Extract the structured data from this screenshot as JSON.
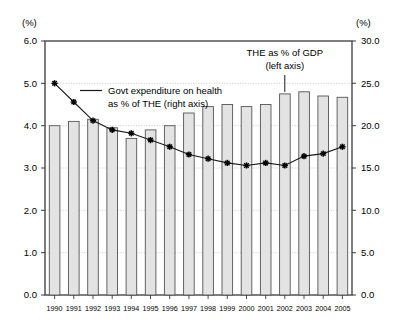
{
  "chart_data": {
    "type": "bar",
    "title": "",
    "categories": [
      "1990",
      "1991",
      "1992",
      "1993",
      "1994",
      "1995",
      "1996",
      "1997",
      "1998",
      "1999",
      "2000",
      "2001",
      "2002",
      "2003",
      "2004",
      "2005"
    ],
    "series": [
      {
        "name": "THE as % of GDP (left axis)",
        "axis": "left",
        "render": "bar",
        "values": [
          4.0,
          4.1,
          4.15,
          3.95,
          3.7,
          3.9,
          4.0,
          4.3,
          4.45,
          4.5,
          4.45,
          4.5,
          4.75,
          4.8,
          4.7,
          4.67
        ]
      },
      {
        "name": "Govt expenditure on health as % of THE (right axis)",
        "axis": "right",
        "render": "line",
        "values": [
          25.0,
          22.8,
          20.6,
          19.5,
          19.1,
          18.3,
          17.5,
          16.6,
          16.1,
          15.6,
          15.3,
          15.6,
          15.3,
          16.4,
          16.7,
          17.5
        ]
      }
    ],
    "xlabel": "",
    "ylabel_left": "(%)",
    "ylabel_right": "(%)",
    "ylim_left": [
      0.0,
      6.0
    ],
    "ylim_right": [
      0.0,
      30.0
    ],
    "yticks_left": [
      "0.0",
      "1.0",
      "2.0",
      "3.0",
      "4.0",
      "5.0",
      "6.0"
    ],
    "yticks_right": [
      "0.0",
      "5.0",
      "10.0",
      "15.0",
      "20.0",
      "25.0",
      "30.0"
    ],
    "grid": true,
    "legend_position": "inside-plot",
    "annotations": [
      {
        "name": "line-series-legend",
        "line1": "Govt expenditure on health",
        "line2": "as % of THE (right axis)"
      },
      {
        "name": "bar-series-callout",
        "line1": "THE as % of GDP",
        "line2": "(left axis)",
        "points_to_category": "2002"
      }
    ],
    "colors": {
      "bar_fill": "#e3e3e3",
      "bar_stroke": "#555555",
      "line_stroke": "#1a1a1a",
      "marker": "#000000",
      "grid": "#bdbdbd",
      "axis": "#3a3a3a",
      "text": "#000000"
    }
  }
}
